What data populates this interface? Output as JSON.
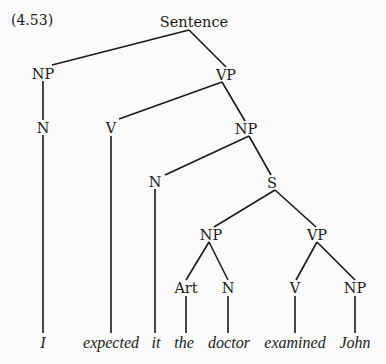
{
  "example_number": "(4.53)",
  "tree": {
    "nodes": [
      {
        "id": "sentence",
        "label": "Sentence",
        "x": 194,
        "y": 22
      },
      {
        "id": "np1",
        "label": "NP",
        "x": 43,
        "y": 74
      },
      {
        "id": "vp1",
        "label": "VP",
        "x": 226,
        "y": 75
      },
      {
        "id": "n1",
        "label": "N",
        "x": 43,
        "y": 128
      },
      {
        "id": "v1",
        "label": "V",
        "x": 111,
        "y": 128
      },
      {
        "id": "np2",
        "label": "NP",
        "x": 246,
        "y": 129
      },
      {
        "id": "n2",
        "label": "N",
        "x": 155,
        "y": 182
      },
      {
        "id": "s",
        "label": "S",
        "x": 272,
        "y": 183
      },
      {
        "id": "np3",
        "label": "NP",
        "x": 211,
        "y": 235
      },
      {
        "id": "vp2",
        "label": "VP",
        "x": 317,
        "y": 235
      },
      {
        "id": "art",
        "label": "Art",
        "x": 186,
        "y": 288
      },
      {
        "id": "n3",
        "label": "N",
        "x": 228,
        "y": 288
      },
      {
        "id": "v2",
        "label": "V",
        "x": 295,
        "y": 288
      },
      {
        "id": "np4",
        "label": "NP",
        "x": 355,
        "y": 288
      }
    ],
    "words": [
      {
        "id": "w-i",
        "label": "I",
        "x": 43,
        "y": 343
      },
      {
        "id": "w-expected",
        "label": "expected",
        "x": 111,
        "y": 343
      },
      {
        "id": "w-it",
        "label": "it",
        "x": 156,
        "y": 343
      },
      {
        "id": "w-the",
        "label": "the",
        "x": 184,
        "y": 343
      },
      {
        "id": "w-doctor",
        "label": "doctor",
        "x": 229,
        "y": 343
      },
      {
        "id": "w-examined",
        "label": "examined",
        "x": 295,
        "y": 343
      },
      {
        "id": "w-john",
        "label": "John",
        "x": 355,
        "y": 343
      }
    ],
    "edges": [
      [
        189,
        30,
        52,
        65
      ],
      [
        189,
        30,
        226,
        67
      ],
      [
        222,
        82,
        119,
        119
      ],
      [
        222,
        82,
        245,
        121
      ],
      [
        43,
        81,
        43,
        120
      ],
      [
        43,
        135,
        43,
        333
      ],
      [
        111,
        136,
        111,
        333
      ],
      [
        249,
        136,
        165,
        175
      ],
      [
        249,
        136,
        271,
        175
      ],
      [
        155,
        189,
        155,
        333
      ],
      [
        275,
        190,
        214,
        227
      ],
      [
        275,
        190,
        316,
        227
      ],
      [
        209,
        242,
        186,
        280
      ],
      [
        209,
        242,
        228,
        280
      ],
      [
        317,
        242,
        296,
        280
      ],
      [
        317,
        242,
        355,
        280
      ],
      [
        186,
        296,
        186,
        333
      ],
      [
        228,
        296,
        228,
        333
      ],
      [
        295,
        296,
        295,
        333
      ],
      [
        355,
        296,
        355,
        333
      ]
    ]
  }
}
